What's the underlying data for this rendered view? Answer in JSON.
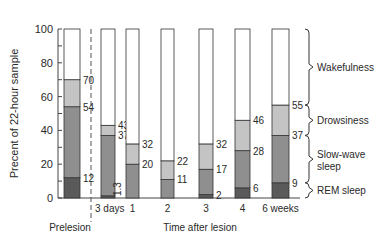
{
  "chart_data": {
    "type": "bar",
    "stacked": true,
    "title": "",
    "xlabel": "Time after lesion",
    "ylabel": "Precent of 22-hour sample",
    "ylim": [
      0,
      100
    ],
    "yticks": [
      0,
      20,
      40,
      60,
      80,
      100
    ],
    "grid": false,
    "categories": [
      "Prelesion",
      "3 days",
      "1",
      "2",
      "3",
      "4",
      "6 weeks"
    ],
    "prelesion_label": "Prelesion",
    "series": [
      {
        "name": "REM sleep",
        "color": "#5a5a5a",
        "values": [
          12,
          1.3,
          0,
          0,
          2,
          6,
          9
        ]
      },
      {
        "name": "Slow-wave sleep",
        "color": "#8f8f8f",
        "values": [
          42,
          35.7,
          20,
          11,
          15,
          22,
          28
        ]
      },
      {
        "name": "Drowsiness",
        "color": "#c4c4c4",
        "values": [
          16,
          6,
          12,
          11,
          15,
          18,
          18
        ]
      },
      {
        "name": "Wakefulness",
        "color": "#ffffff",
        "values": [
          30,
          57,
          68,
          78,
          68,
          54,
          45
        ]
      }
    ],
    "cumulative_labels": [
      [
        "12",
        "54",
        "70"
      ],
      [
        "1.3",
        "37",
        "43"
      ],
      [
        "20",
        "32"
      ],
      [
        "11",
        "22"
      ],
      [
        "2",
        "17",
        "32"
      ],
      [
        "6",
        "28",
        "46"
      ],
      [
        "9",
        "37",
        "55"
      ]
    ],
    "legend": {
      "position": "right",
      "entries": [
        "Wakefulness",
        "Drowsiness",
        "Slow-wave sleep",
        "REM sleep"
      ]
    }
  }
}
